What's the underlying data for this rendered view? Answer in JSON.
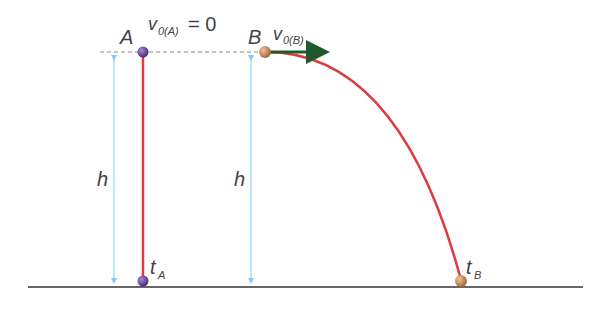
{
  "diagram": {
    "type": "physics-free-fall-vs-projectile",
    "colors": {
      "trajectory": "#e0393e",
      "height_arrow": "#7fd0ee",
      "ground": "#333333",
      "dashed_line": "#888888",
      "ball_A": "#6a4a9a",
      "ball_B": "#c98a5a",
      "velocity_arrow": "#1f5a2e"
    },
    "ball_A": {
      "label": "A",
      "velocity_symbol": "v",
      "velocity_subscript": "0(A)",
      "velocity_equation": "= 0",
      "time_symbol": "t",
      "time_subscript": "A"
    },
    "ball_B": {
      "label": "B",
      "velocity_symbol": "v",
      "velocity_subscript": "0(B)",
      "time_symbol": "t",
      "time_subscript": "B"
    },
    "height_label_left": "h",
    "height_label_right": "h"
  }
}
